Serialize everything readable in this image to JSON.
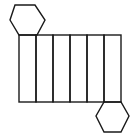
{
  "figure": {
    "stroke_color": "#1a1a1a",
    "background": "#ffffff"
  },
  "lateral_faces": {
    "count": 6,
    "x": 19,
    "y": 35,
    "panel_width": 17,
    "height": 67
  },
  "top_hexagon": {
    "points": "15,5 35,5 45,20 37,35 19,35 10,20"
  },
  "bottom_hexagon": {
    "points": "104,102 121,102 129,116 121,132 104,132 96,116"
  }
}
